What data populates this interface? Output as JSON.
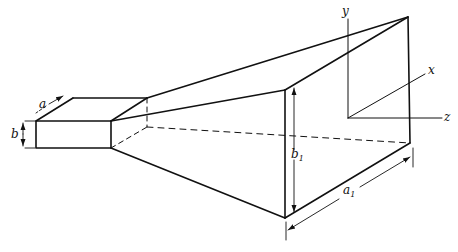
{
  "diagram": {
    "labels": {
      "a": "a",
      "b": "b",
      "a1": "a",
      "a1_sub": "1",
      "b1": "b",
      "b1_sub": "1",
      "x": "x",
      "y": "y",
      "z": "z"
    },
    "colors": {
      "line": "#111111",
      "background": "#ffffff"
    }
  }
}
